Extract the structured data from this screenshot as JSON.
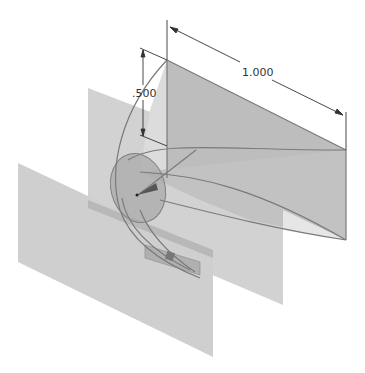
{
  "view": {
    "type": "isometric 3D CAD sketch",
    "background": "#ffffff"
  },
  "dimensions": {
    "width_label": "1.000",
    "height_label": ".500"
  },
  "colors": {
    "plane_light": "#d2d2d2",
    "plane_mid": "#c4c4c4",
    "surface_dark": "#b4b4b4",
    "ellipse": "#a8a8a8",
    "edge": "#777777",
    "dim_line": "#333333"
  },
  "parts": {
    "back_plane": "vertical work plane (rear)",
    "front_plane": "vertical work plane (front-left)",
    "sweep_surface": "triangular lofted surface",
    "profile_ellipse": "elliptical profile sketch",
    "guide_rail": "rectangular guide rail strip"
  }
}
